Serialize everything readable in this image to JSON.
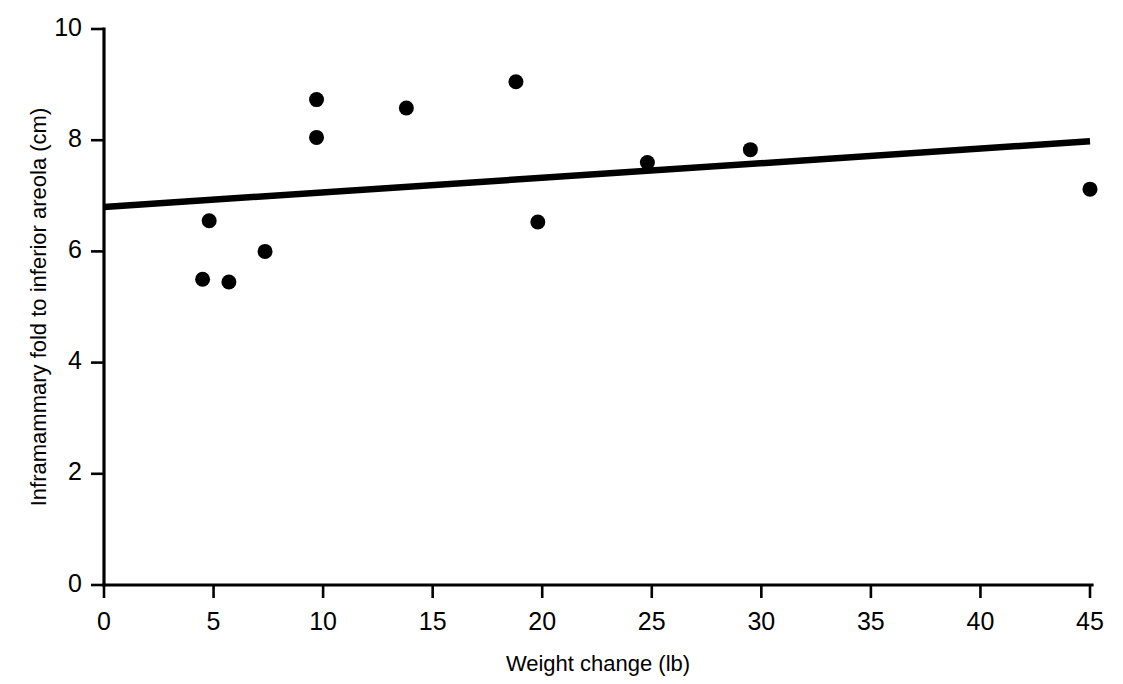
{
  "chart_data": {
    "type": "scatter",
    "title": "",
    "subtitle": "",
    "xlabel": "Weight change (lb)",
    "ylabel": "Inframammary fold to inferior areola (cm)",
    "xlim": [
      0,
      45
    ],
    "ylim": [
      0,
      10
    ],
    "xticks": [
      0,
      5,
      10,
      15,
      20,
      25,
      30,
      35,
      40,
      45
    ],
    "yticks": [
      0,
      2,
      4,
      6,
      8,
      10
    ],
    "xtick_labels": [
      "0",
      "5",
      "10",
      "15",
      "20",
      "25",
      "30",
      "35",
      "40",
      "45"
    ],
    "ytick_labels": [
      "0",
      "2",
      "4",
      "6",
      "8",
      "10"
    ],
    "grid": false,
    "legend": null,
    "legend_position": "none",
    "marker": "filled-circle",
    "marker_color": "#000000",
    "points": [
      {
        "x": 4.5,
        "y": 5.5
      },
      {
        "x": 4.8,
        "y": 6.55
      },
      {
        "x": 5.7,
        "y": 5.45
      },
      {
        "x": 7.35,
        "y": 6.0
      },
      {
        "x": 9.7,
        "y": 8.05
      },
      {
        "x": 9.7,
        "y": 8.73
      },
      {
        "x": 13.8,
        "y": 8.58
      },
      {
        "x": 18.8,
        "y": 9.05
      },
      {
        "x": 19.8,
        "y": 6.53
      },
      {
        "x": 24.8,
        "y": 7.6
      },
      {
        "x": 29.5,
        "y": 7.83
      },
      {
        "x": 45.0,
        "y": 7.12
      }
    ],
    "series": [
      {
        "name": "observations",
        "type": "scatter",
        "x": [
          4.5,
          4.8,
          5.7,
          7.35,
          9.7,
          9.7,
          13.8,
          18.8,
          19.8,
          24.8,
          29.5,
          45.0
        ],
        "values": [
          5.5,
          6.55,
          5.45,
          6.0,
          8.05,
          8.73,
          8.58,
          9.05,
          6.53,
          7.6,
          7.83,
          7.12
        ]
      },
      {
        "name": "regression-line",
        "type": "line",
        "x": [
          0,
          45
        ],
        "values": [
          6.8,
          7.98
        ],
        "color": "#000000"
      }
    ],
    "trendline": {
      "x_start": 0,
      "y_start": 6.8,
      "x_end": 45,
      "y_end": 7.98
    },
    "annotations": []
  }
}
